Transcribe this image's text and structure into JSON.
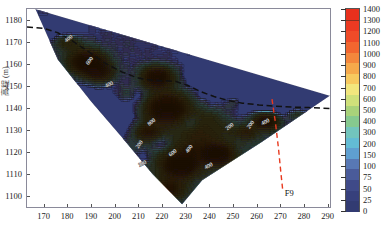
{
  "figure": {
    "kind": "filled-contour-map",
    "y_axis_title": "高程 (m)",
    "f9_annotation": "F9"
  },
  "chart_data": {
    "type": "heatmap",
    "title": "",
    "subtitle": "",
    "xlabel": "",
    "ylabel": "高程 (m)",
    "xlim": [
      163,
      291
    ],
    "ylim": [
      1095,
      1185
    ],
    "grid": false,
    "legend_position": "right",
    "x_ticks": [
      170,
      180,
      190,
      200,
      210,
      220,
      230,
      240,
      250,
      260,
      270,
      280,
      290
    ],
    "y_ticks": [
      1100,
      1110,
      1120,
      1130,
      1140,
      1150,
      1160,
      1170,
      1180
    ],
    "colorbar": {
      "tick_labels": [
        "1400",
        "1300",
        "1200",
        "1100",
        "1000",
        "900",
        "800",
        "700",
        "600",
        "500",
        "400",
        "300",
        "200",
        "150",
        "100",
        "75",
        "50",
        "25",
        "0"
      ],
      "levels": [
        0,
        25,
        50,
        75,
        100,
        150,
        200,
        300,
        400,
        500,
        600,
        700,
        800,
        900,
        1000,
        1100,
        1200,
        1300,
        1400
      ],
      "colors": [
        "#323b72",
        "#37407c",
        "#3f4a88",
        "#4a5b9a",
        "#5878b4",
        "#5f9fd0",
        "#63bcd4",
        "#72c5bd",
        "#86c98f",
        "#a9d27a",
        "#cfe07a",
        "#f2e67d",
        "#f7c95f",
        "#f6a94b",
        "#f4873c",
        "#f2662f",
        "#ef4b28",
        "#ec3a22",
        "#e8301d"
      ],
      "orientation": "vertical"
    },
    "annotations": [
      {
        "text": "F9",
        "kind": "fault-line-label",
        "x": 271,
        "y": 1101
      },
      {
        "text": "400",
        "kind": "contour-label",
        "x": 181,
        "y": 1171
      },
      {
        "text": "600",
        "kind": "contour-label",
        "x": 190,
        "y": 1161
      },
      {
        "text": "400",
        "kind": "contour-label",
        "x": 198,
        "y": 1150
      },
      {
        "text": "800",
        "kind": "contour-label",
        "x": 216,
        "y": 1133
      },
      {
        "text": "200",
        "kind": "contour-label",
        "x": 211,
        "y": 1123
      },
      {
        "text": "100",
        "kind": "contour-label",
        "x": 212,
        "y": 1114
      },
      {
        "text": "600",
        "kind": "contour-label",
        "x": 225,
        "y": 1119
      },
      {
        "text": "400",
        "kind": "contour-label",
        "x": 232,
        "y": 1121
      },
      {
        "text": "400",
        "kind": "contour-label",
        "x": 240,
        "y": 1113
      },
      {
        "text": "200",
        "kind": "contour-label",
        "x": 249,
        "y": 1131
      },
      {
        "text": "200",
        "kind": "contour-label",
        "x": 258,
        "y": 1132
      },
      {
        "text": "400",
        "kind": "contour-label",
        "x": 264,
        "y": 1133
      }
    ],
    "fault_line": {
      "label": "F9",
      "color": "#e8391e",
      "style": "dashed",
      "points": [
        [
          266.5,
          1144
        ],
        [
          268.0,
          1133
        ],
        [
          269.2,
          1122
        ],
        [
          270.3,
          1110
        ],
        [
          271.0,
          1103
        ]
      ]
    },
    "horizon_line": {
      "color": "#111111",
      "style": "dashed",
      "points": [
        [
          163,
          1176.8
        ],
        [
          170,
          1176.2
        ],
        [
          176,
          1174.2
        ],
        [
          182,
          1170.6
        ],
        [
          189,
          1165.6
        ],
        [
          196,
          1160.4
        ],
        [
          203,
          1156.4
        ],
        [
          210,
          1153.6
        ],
        [
          216,
          1152.6
        ],
        [
          221,
          1152.4
        ],
        [
          226,
          1152.0
        ],
        [
          231,
          1150.2
        ],
        [
          236,
          1147.6
        ],
        [
          242,
          1145.2
        ],
        [
          248,
          1143.4
        ],
        [
          254,
          1142.2
        ],
        [
          261,
          1141.4
        ],
        [
          268,
          1140.8
        ],
        [
          275,
          1140.4
        ],
        [
          282,
          1140.2
        ],
        [
          291,
          1139.8
        ]
      ]
    },
    "domain_polygon": [
      [
        166.5,
        1185.0
      ],
      [
        291.0,
        1145.6
      ],
      [
        262.0,
        1124.4
      ],
      [
        237.0,
        1107.2
      ],
      [
        228.5,
        1096.2
      ],
      [
        216.0,
        1110.0
      ],
      [
        205.0,
        1124.2
      ],
      [
        190.0,
        1143.0
      ],
      [
        176.0,
        1162.0
      ]
    ],
    "field_note": "Scalar field shown is a contoured anomaly/resistivity section; peak highs (>1000) occur near x=188/y=1161, x=218/y=1154, x=222/y=1139, x=228/y=1114, x=243/y=1119, x=264/y=1134.",
    "peaks": [
      {
        "x": 188,
        "y": 1161,
        "value": 1400,
        "radius": 7
      },
      {
        "x": 194,
        "y": 1156,
        "value": 900,
        "radius": 6
      },
      {
        "x": 218,
        "y": 1154,
        "value": 1400,
        "radius": 6
      },
      {
        "x": 222,
        "y": 1140,
        "value": 1400,
        "radius": 9
      },
      {
        "x": 214,
        "y": 1129,
        "value": 800,
        "radius": 5
      },
      {
        "x": 228,
        "y": 1114,
        "value": 1400,
        "radius": 7
      },
      {
        "x": 223,
        "y": 1103,
        "value": 900,
        "radius": 6
      },
      {
        "x": 243,
        "y": 1119,
        "value": 1400,
        "radius": 6
      },
      {
        "x": 264,
        "y": 1134,
        "value": 1300,
        "radius": 5
      },
      {
        "x": 256,
        "y": 1129,
        "value": 600,
        "radius": 4
      },
      {
        "x": 236,
        "y": 1128,
        "value": 450,
        "radius": 7
      },
      {
        "x": 205,
        "y": 1146,
        "value": 300,
        "radius": 5
      },
      {
        "x": 180,
        "y": 1170,
        "value": 700,
        "radius": 5
      },
      {
        "x": 277,
        "y": 1137,
        "value": 500,
        "radius": 4
      },
      {
        "x": 250,
        "y": 1143,
        "value": 350,
        "radius": 5
      },
      {
        "x": 240,
        "y": 1136,
        "value": 320,
        "radius": 6
      },
      {
        "x": 232,
        "y": 1121,
        "value": 400,
        "radius": 5
      },
      {
        "x": 248,
        "y": 1130,
        "value": 250,
        "radius": 5
      }
    ],
    "lows": [
      {
        "x": 200,
        "y": 1135,
        "value": 10,
        "radius": 12
      },
      {
        "x": 250,
        "y": 1150,
        "value": 15,
        "radius": 14
      },
      {
        "x": 272,
        "y": 1145,
        "value": 10,
        "radius": 12
      },
      {
        "x": 178,
        "y": 1175,
        "value": 30,
        "radius": 8
      },
      {
        "x": 210,
        "y": 1145,
        "value": 90,
        "radius": 4
      },
      {
        "x": 232,
        "y": 1133,
        "value": 180,
        "radius": 4
      },
      {
        "x": 219,
        "y": 1124,
        "value": 90,
        "radius": 4
      },
      {
        "x": 212,
        "y": 1118,
        "value": 90,
        "radius": 4
      }
    ]
  }
}
